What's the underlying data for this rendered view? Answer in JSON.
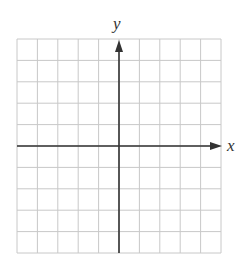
{
  "diagram": {
    "type": "coordinate-plane",
    "x_label": "x",
    "y_label": "y",
    "grid": {
      "columns": 10,
      "rows": 10,
      "left": 17,
      "top": 39,
      "right": 221,
      "bottom": 253
    },
    "origin": {
      "col": 5,
      "row": 5
    },
    "axes": {
      "x_arrow": "positive-only",
      "y_arrow": "positive-only"
    },
    "colors": {
      "grid_line": "#c8c8c8",
      "axis_line": "#333333",
      "label": "#333333",
      "background": "#ffffff"
    }
  }
}
